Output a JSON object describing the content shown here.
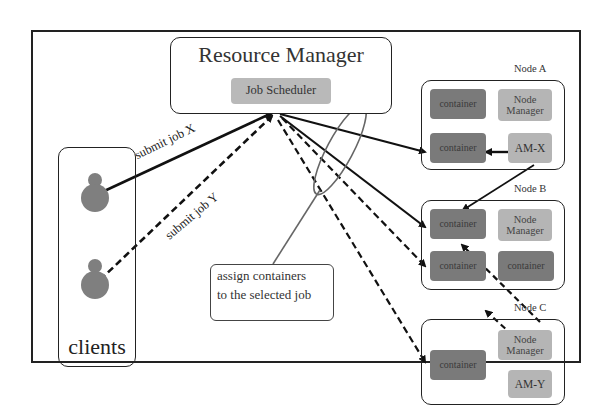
{
  "diagram": {
    "resource_manager": {
      "title": "Resource Manager",
      "scheduler": "Job Scheduler"
    },
    "clients": {
      "label": "clients",
      "count": 2
    },
    "edges": {
      "submit_x": "submit job X",
      "submit_y": "submit job Y"
    },
    "callout": {
      "line1": "assign containers",
      "line2": "to the selected job"
    },
    "nodes": [
      {
        "label": "Node A",
        "cells": [
          "container",
          "Node Manager",
          "container",
          "AM-X"
        ]
      },
      {
        "label": "Node B",
        "cells": [
          "container",
          "Node Manager",
          "container",
          "container"
        ]
      },
      {
        "label": "Node C",
        "cells": [
          "container",
          "Node Manager",
          "AM-Y"
        ]
      }
    ],
    "colors": {
      "container": "#7a7a7a",
      "node_manager": "#b5b5b5",
      "scheduler": "#b9b9b9",
      "client": "#7f7f7f",
      "line": "#1a1a1a"
    }
  }
}
